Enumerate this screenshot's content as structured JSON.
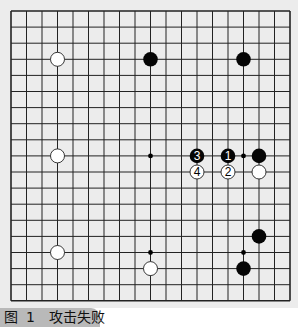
{
  "figure": {
    "caption_prefix": "图",
    "caption_number": "1",
    "caption_title": "攻击失败"
  },
  "board": {
    "size": 19,
    "origin_x": 11,
    "origin_y": 11,
    "step_x": 15.5,
    "step_y": 16.1,
    "line_color": "#222222",
    "background": "#ececec",
    "hoshi": [
      [
        3,
        3
      ],
      [
        9,
        3
      ],
      [
        15,
        3
      ],
      [
        3,
        9
      ],
      [
        9,
        9
      ],
      [
        15,
        9
      ],
      [
        3,
        15
      ],
      [
        9,
        15
      ],
      [
        15,
        15
      ]
    ],
    "stones": [
      {
        "color": "white",
        "col": 3,
        "row": 3,
        "label": ""
      },
      {
        "color": "black",
        "col": 9,
        "row": 3,
        "label": ""
      },
      {
        "color": "black",
        "col": 15,
        "row": 3,
        "label": ""
      },
      {
        "color": "white",
        "col": 3,
        "row": 9,
        "label": ""
      },
      {
        "color": "black",
        "col": 12,
        "row": 9,
        "label": "3"
      },
      {
        "color": "black",
        "col": 14,
        "row": 9,
        "label": "1"
      },
      {
        "color": "black",
        "col": 16,
        "row": 9,
        "label": ""
      },
      {
        "color": "white",
        "col": 12,
        "row": 10,
        "label": "4"
      },
      {
        "color": "white",
        "col": 14,
        "row": 10,
        "label": "2"
      },
      {
        "color": "white",
        "col": 16,
        "row": 10,
        "label": ""
      },
      {
        "color": "black",
        "col": 16,
        "row": 14,
        "label": ""
      },
      {
        "color": "white",
        "col": 3,
        "row": 15,
        "label": ""
      },
      {
        "color": "white",
        "col": 9,
        "row": 16,
        "label": ""
      },
      {
        "color": "black",
        "col": 15,
        "row": 16,
        "label": ""
      }
    ]
  }
}
